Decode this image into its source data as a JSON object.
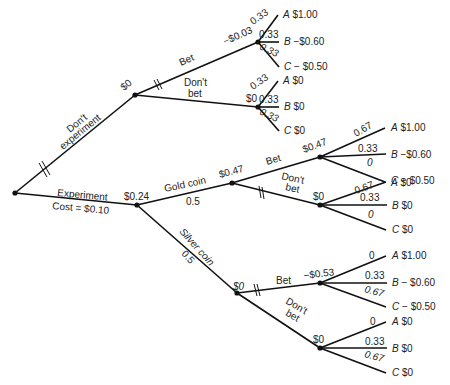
{
  "diagram": {
    "type": "decision-tree",
    "root": {
      "branches": {
        "dont_experiment": {
          "label_line1": "Don't",
          "label_line2": "experiment",
          "value": "$0",
          "pruned": true
        },
        "experiment": {
          "label": "Experiment",
          "cost": "Cost = $0.10",
          "value": "$0.24"
        }
      }
    },
    "no_experiment": {
      "bet": {
        "label": "Bet",
        "value": "−$0.03",
        "pruned": true,
        "outcomes": [
          {
            "prob": "0.33",
            "letter": "A",
            "payoff": "$1.00"
          },
          {
            "prob": "0.33",
            "letter": "B",
            "payoff": "−$0.60"
          },
          {
            "prob": "0.33",
            "letter": "C",
            "payoff": "− $0.50"
          }
        ]
      },
      "dont_bet": {
        "label_line1": "Don't",
        "label_line2": "bet",
        "value": "$0",
        "outcomes": [
          {
            "prob": "0.33",
            "letter": "A",
            "payoff": "$0"
          },
          {
            "prob": "0.33",
            "letter": "B",
            "payoff": "$0"
          },
          {
            "prob": "0.33",
            "letter": "C",
            "payoff": "$0"
          }
        ]
      }
    },
    "gold": {
      "label": "Gold coin",
      "prob": "0.5",
      "value": "$0.47",
      "bet": {
        "label": "Bet",
        "value": "$0.47",
        "outcomes": [
          {
            "prob": "0.67",
            "letter": "A",
            "payoff": "$1.00"
          },
          {
            "prob": "0.33",
            "letter": "B",
            "payoff": "−$0.60"
          },
          {
            "prob": "0",
            "letter": "C",
            "payoff": "− $0.50"
          }
        ]
      },
      "dont_bet": {
        "label_line1": "Don't",
        "label_line2": "bet",
        "value": "$0",
        "pruned": true,
        "outcomes": [
          {
            "prob": "0.67",
            "letter": "A",
            "payoff": "$0"
          },
          {
            "prob": "0.33",
            "letter": "B",
            "payoff": "$0"
          },
          {
            "prob": "0",
            "letter": "C",
            "payoff": "$0"
          }
        ]
      }
    },
    "silver": {
      "label": "Silver coin",
      "prob": "0.5",
      "value": "$0",
      "bet": {
        "label": "Bet",
        "value": "−$0.53",
        "pruned": true,
        "outcomes": [
          {
            "prob": "0",
            "letter": "A",
            "payoff": "$1.00"
          },
          {
            "prob": "0.33",
            "letter": "B",
            "payoff": "− $0.60"
          },
          {
            "prob": "0.67",
            "letter": "C",
            "payoff": "− $0.50"
          }
        ]
      },
      "dont_bet": {
        "label_line1": "Don't",
        "label_line2": "bet",
        "value": "$0",
        "outcomes": [
          {
            "prob": "0",
            "letter": "A",
            "payoff": "$0"
          },
          {
            "prob": "0.33",
            "letter": "B",
            "payoff": "$0"
          },
          {
            "prob": "0.67",
            "letter": "C",
            "payoff": "$0"
          }
        ]
      }
    }
  }
}
